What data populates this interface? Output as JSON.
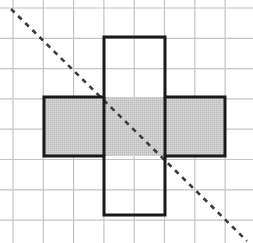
{
  "figure": {
    "caption": "",
    "canvas": {
      "width": 253,
      "height": 243,
      "background": "#ffffff"
    },
    "grid": {
      "name": "square-grid",
      "cell_size": 30.3,
      "origin_x": 13,
      "origin_y": 8,
      "columns": 8,
      "rows": 8,
      "line_color": "#c4c4c4",
      "line_width": 1.2,
      "visible": true
    },
    "shape": {
      "name": "cube-net-cross",
      "description": "Plus / cross shaped net of six unit squares",
      "stroke_color": "#1a1a1a",
      "stroke_width": 3,
      "fill_color": "#c9c9c9",
      "fill_squares_label": "horizontal bar of three squares shaded",
      "squares": [
        {
          "label": "top-square",
          "col": 3,
          "row": 1,
          "shaded": false
        },
        {
          "label": "left-square",
          "col": 1,
          "row": 3,
          "shaded": true
        },
        {
          "label": "center-square",
          "col": 3,
          "row": 3,
          "shaded": true
        },
        {
          "label": "right-square",
          "col": 5,
          "row": 3,
          "shaded": true
        },
        {
          "label": "bottom-square",
          "col": 3,
          "row": 5,
          "shaded": false
        }
      ],
      "outline_path": "M104,37 L165,37 L165,97 L225,97 L225,156 L165,156 L165,215 L104,215 L104,156 L44,156 L44,97 L104,97 Z",
      "shaded_rect": {
        "x": 44,
        "y": 97,
        "width": 181,
        "height": 59
      },
      "inner_divider_lines": [
        {
          "label": "left-center-divider",
          "x1": 104,
          "y1": 97,
          "x2": 104,
          "y2": 156
        },
        {
          "label": "center-right-divider",
          "x1": 165,
          "y1": 97,
          "x2": 165,
          "y2": 156
        }
      ]
    },
    "dashed_line": {
      "name": "diagonal-dashed-line",
      "color": "#3c3c3c",
      "width": 2.6,
      "dash": "5 5",
      "x1": 11,
      "y1": 9,
      "x2": 247,
      "y2": 241,
      "slope_description": "descends left to right at about 45 degrees"
    }
  }
}
